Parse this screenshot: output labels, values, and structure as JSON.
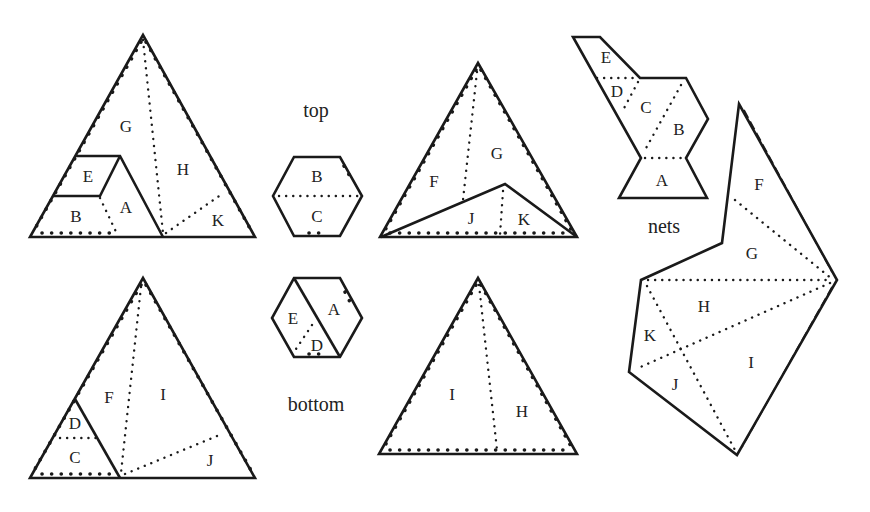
{
  "figure": {
    "captions": {
      "top": "top",
      "bottom": "bottom",
      "nets": "nets"
    },
    "triangle_top_left": {
      "pieces": [
        "G",
        "H",
        "E",
        "A",
        "B",
        "K"
      ]
    },
    "hexagon_top": {
      "pieces": [
        "B",
        "C"
      ]
    },
    "triangle_top_middle": {
      "pieces": [
        "F",
        "G",
        "J",
        "K"
      ]
    },
    "triangle_bottom_left": {
      "pieces": [
        "F",
        "I",
        "D",
        "C",
        "J"
      ]
    },
    "hexagon_bottom": {
      "pieces": [
        "E",
        "A",
        "D"
      ]
    },
    "triangle_bottom_middle": {
      "pieces": [
        "I",
        "H"
      ]
    },
    "net_small": {
      "pieces": [
        "E",
        "D",
        "C",
        "B",
        "A"
      ]
    },
    "net_large": {
      "pieces": [
        "F",
        "G",
        "H",
        "K",
        "J",
        "I"
      ]
    }
  }
}
